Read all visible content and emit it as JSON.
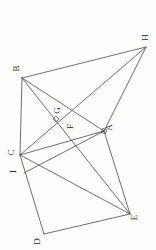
{
  "document": {
    "kind": "geometry-figure",
    "orientation": "rotated-90-ccw",
    "background_color": "#fdfdfc",
    "stroke_color": "#4a4a4a",
    "label_color": "#2a2a2a"
  },
  "annotation_text": {
    "line1": "り、",
    "line2": "の",
    "line3": "とこ",
    "line4": "交点",
    "line5": "はF",
    "line6": "をと"
  },
  "figure": {
    "points": [
      {
        "id": "A",
        "label": "A",
        "x": 104,
        "y": 131,
        "label_x": 110,
        "label_y": 128
      },
      {
        "id": "B",
        "label": "B",
        "x": 22,
        "y": 78,
        "label_x": 17,
        "label_y": 69
      },
      {
        "id": "C",
        "label": "C",
        "x": 20,
        "y": 155,
        "label_x": 12,
        "label_y": 153
      },
      {
        "id": "D",
        "label": "D",
        "x": 44,
        "y": 234,
        "label_x": 38,
        "label_y": 242
      },
      {
        "id": "E",
        "label": "E",
        "x": 130,
        "y": 214,
        "label_x": 136,
        "label_y": 218
      },
      {
        "id": "F",
        "label": "F",
        "x": 76,
        "y": 134,
        "label_x": 72,
        "label_y": 127
      },
      {
        "id": "G",
        "label": "G",
        "x": 56,
        "y": 119,
        "label_x": 58,
        "label_y": 111
      },
      {
        "id": "H",
        "label": "H",
        "x": 146,
        "y": 47,
        "label_x": 146,
        "label_y": 38
      },
      {
        "id": "I",
        "label": "I",
        "x": 24,
        "y": 173,
        "label_x": 16,
        "label_y": 172
      }
    ],
    "segments": [
      {
        "name": "B-C",
        "from": "B",
        "to": "C"
      },
      {
        "name": "B-A",
        "from": "B",
        "to": "A"
      },
      {
        "name": "B-E",
        "from": "B",
        "to": "E"
      },
      {
        "name": "B-H",
        "from": "B",
        "to": "H"
      },
      {
        "name": "C-A",
        "from": "C",
        "to": "A"
      },
      {
        "name": "C-H",
        "from": "C",
        "to": "H"
      },
      {
        "name": "C-E",
        "from": "C",
        "to": "E"
      },
      {
        "name": "C-D",
        "from": "C",
        "to": "D"
      },
      {
        "name": "D-E",
        "from": "D",
        "to": "E"
      },
      {
        "name": "A-E",
        "from": "A",
        "to": "E"
      },
      {
        "name": "A-H",
        "from": "A",
        "to": "H"
      },
      {
        "name": "I-A",
        "from": "I",
        "to": "A"
      }
    ],
    "right_angle_marks": [
      {
        "name": "right-angle-at-G",
        "x": 56,
        "y": 119,
        "rotation": 42
      },
      {
        "name": "right-angle-at-A",
        "x": 104,
        "y": 131,
        "rotation": 20
      }
    ]
  }
}
